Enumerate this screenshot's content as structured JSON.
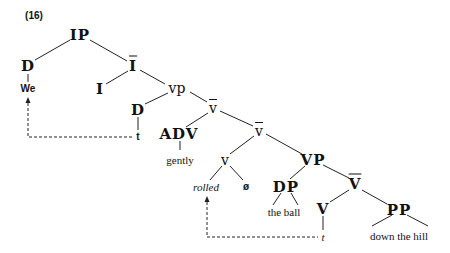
{
  "example_number": "(16)",
  "tree": {
    "nodes": {
      "IP": "IP",
      "D_subject": "D",
      "We": "We",
      "I_bar": "I",
      "I": "I",
      "vp": "vp",
      "D_trace_node": "D",
      "t_subject": "t",
      "v_bar_1": "v",
      "ADV": "ADV",
      "gently": "gently",
      "v_bar_2": "v",
      "v": "v",
      "rolled": "rolled",
      "null": "ø",
      "VP": "VP",
      "DP": "DP",
      "the_ball": "the ball",
      "V_bar": "V",
      "V": "V",
      "t_verb": "t",
      "PP": "PP",
      "down_the_hill": "down the hill"
    },
    "movement_arrows": [
      {
        "from": "t_subject",
        "to": "We",
        "style": "dashed"
      },
      {
        "from": "t_verb",
        "to": "rolled",
        "style": "dashed"
      }
    ]
  }
}
